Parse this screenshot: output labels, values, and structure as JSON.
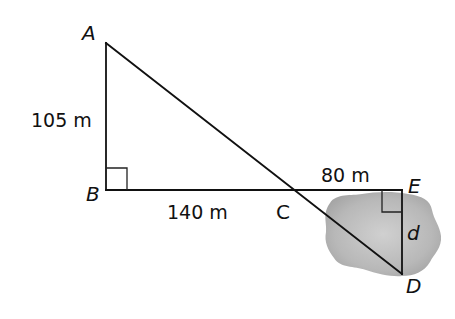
{
  "diagram": {
    "type": "geometry",
    "points": {
      "A": {
        "label": "A",
        "x": 106,
        "y": 43
      },
      "B": {
        "label": "B",
        "x": 106,
        "y": 190
      },
      "C": {
        "label": "C",
        "x": 294,
        "y": 190
      },
      "E": {
        "label": "E",
        "x": 402,
        "y": 190
      },
      "D": {
        "label": "D",
        "x": 402,
        "y": 274
      }
    },
    "segments": [
      {
        "from": "A",
        "to": "B"
      },
      {
        "from": "B",
        "to": "E"
      },
      {
        "from": "A",
        "to": "D"
      },
      {
        "from": "E",
        "to": "D"
      }
    ],
    "right_angles": [
      "B",
      "E"
    ],
    "measurements": {
      "AB": "105 m",
      "BC": "140 m",
      "CE": "80 m",
      "ED": "d"
    },
    "obstacle": {
      "name": "pond",
      "color": "#b5b5b5"
    }
  }
}
